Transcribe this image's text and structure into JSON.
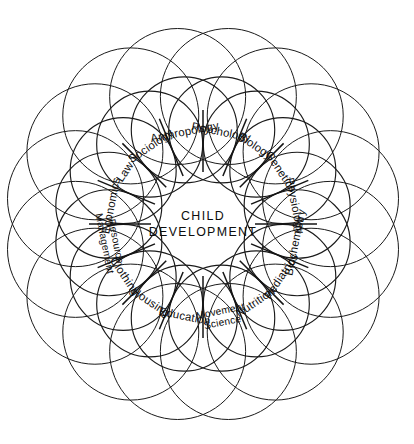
{
  "figure": {
    "center": {
      "line1": "CHILD",
      "line2": "DEVELOPMENT"
    },
    "background_color": "#ffffff",
    "line_color": "#1a1a1a",
    "text_color": "#0d0d0d",
    "geometry": {
      "center_x": 203,
      "center_y": 224,
      "outer_ring_radius": 130,
      "outer_circle_radius": 68,
      "inner_ring_radius": 96,
      "inner_circle_radius": 53,
      "label_radius": 94,
      "petal_count": 16
    },
    "petals": [
      {
        "index": 0,
        "angle": -78.75,
        "label": "Psychology",
        "lines": [
          "Psychology"
        ]
      },
      {
        "index": 1,
        "angle": -56.25,
        "label": "Biology",
        "lines": [
          "Biology"
        ]
      },
      {
        "index": 2,
        "angle": -33.75,
        "label": "Genetics",
        "lines": [
          "Genetics"
        ]
      },
      {
        "index": 3,
        "angle": -11.25,
        "label": "Physiology",
        "lines": [
          "Physiology"
        ]
      },
      {
        "index": 4,
        "angle": 11.25,
        "label": "Biochemistry",
        "lines": [
          "Biochemistry"
        ]
      },
      {
        "index": 5,
        "angle": 33.75,
        "label": "Pediatrics",
        "lines": [
          "Pediatrics"
        ]
      },
      {
        "index": 6,
        "angle": 56.25,
        "label": "Nutrition",
        "lines": [
          "Nutrition"
        ]
      },
      {
        "index": 7,
        "angle": 78.75,
        "label": "Movement Science",
        "lines": [
          "Movement",
          "Science"
        ]
      },
      {
        "index": 8,
        "angle": 101.25,
        "label": "Education",
        "lines": [
          "Education"
        ]
      },
      {
        "index": 9,
        "angle": 123.75,
        "label": "Housing",
        "lines": [
          "Housing"
        ]
      },
      {
        "index": 10,
        "angle": 146.25,
        "label": "Clothing",
        "lines": [
          "Clothing"
        ]
      },
      {
        "index": 11,
        "angle": 168.75,
        "label": "Resource Management",
        "lines": [
          "Resource",
          "Management"
        ]
      },
      {
        "index": 12,
        "angle": 191.25,
        "label": "Economics",
        "lines": [
          "Economics"
        ]
      },
      {
        "index": 13,
        "angle": 213.75,
        "label": "Law",
        "lines": [
          "Law"
        ]
      },
      {
        "index": 14,
        "angle": 236.25,
        "label": "Sociology",
        "lines": [
          "Sociology"
        ]
      },
      {
        "index": 15,
        "angle": 258.75,
        "label": "Anthropology",
        "lines": [
          "Anthropology"
        ]
      }
    ]
  }
}
